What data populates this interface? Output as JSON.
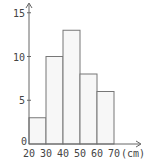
{
  "chart_data": {
    "type": "bar",
    "title": "",
    "xlabel": "(cm)",
    "ylabel": "",
    "histogram": true,
    "bin_edges": [
      20,
      30,
      40,
      50,
      60,
      70
    ],
    "categories": [
      "20-30",
      "30-40",
      "40-50",
      "50-60",
      "60-70"
    ],
    "values": [
      3,
      10,
      13,
      8,
      6
    ],
    "x_tick_labels": [
      "20",
      "30",
      "40",
      "50",
      "60",
      "70"
    ],
    "x_unit": "(cm)",
    "y_tick_labels": [
      "0",
      "5",
      "10",
      "15"
    ],
    "y_ticks": [
      0,
      5,
      10,
      15
    ],
    "ylim": [
      0,
      16
    ],
    "grid": false,
    "legend": null,
    "colors": {
      "bar_fill": "#f7f7f7",
      "bar_stroke": "#777777",
      "axis": "#666666"
    }
  }
}
